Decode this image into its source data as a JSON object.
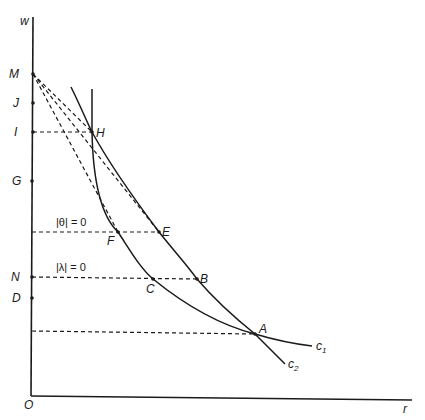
{
  "axes": {
    "x_label": "r",
    "y_label": "w",
    "origin_label": "O"
  },
  "y_axis_points": [
    {
      "label": "M",
      "y": 74
    },
    {
      "label": "J",
      "y": 103
    },
    {
      "label": "I",
      "y": 132
    },
    {
      "label": "G",
      "y": 181
    },
    {
      "label": "N",
      "y": 277
    },
    {
      "label": "D",
      "y": 298
    }
  ],
  "curves": {
    "c1": {
      "label": "c",
      "subscript": "1"
    },
    "c2": {
      "label": "c",
      "subscript": "2"
    }
  },
  "points": {
    "H": "H",
    "E": "E",
    "F": "F",
    "B": "B",
    "C": "C",
    "A": "A"
  },
  "annotations": {
    "theta": "|θ| = 0",
    "lambda": "|λ| = 0"
  },
  "colors": {
    "ink": "#1a1a1a",
    "background": "#ffffff"
  }
}
